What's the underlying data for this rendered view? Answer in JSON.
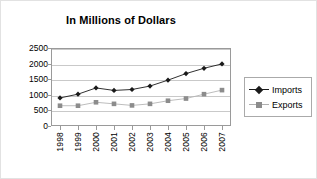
{
  "chart_data": {
    "type": "line",
    "title": "In Millions of Dollars",
    "xlabel": "",
    "ylabel": "",
    "categories": [
      "1998",
      "1999",
      "2000",
      "2001",
      "2002",
      "2003",
      "2004",
      "2005",
      "2006",
      "2007"
    ],
    "series": [
      {
        "name": "Imports",
        "marker": "diamond",
        "color": "#1a1a1a",
        "values": [
          900,
          1020,
          1220,
          1140,
          1170,
          1280,
          1470,
          1680,
          1850,
          1990
        ]
      },
      {
        "name": "Exports",
        "marker": "square",
        "color": "#8c8c8c",
        "values": [
          650,
          650,
          760,
          710,
          660,
          710,
          810,
          880,
          1020,
          1150
        ]
      }
    ],
    "ylim": [
      0,
      2500
    ],
    "yticks": [
      0,
      500,
      1000,
      1500,
      2000,
      2500
    ],
    "ytick_labels": [
      "0",
      "500",
      "1000",
      "1500",
      "2000",
      "2500"
    ],
    "grid": true,
    "legend_position": "right"
  },
  "legend": {
    "entries": [
      {
        "label": "Imports"
      },
      {
        "label": "Exports"
      }
    ]
  },
  "colors": {
    "imports": "#1a1a1a",
    "exports": "#8c8c8c",
    "gridline": "#c9c9c9",
    "axis": "#9a9a9a",
    "background": "#ffffff",
    "text": "#000000"
  }
}
